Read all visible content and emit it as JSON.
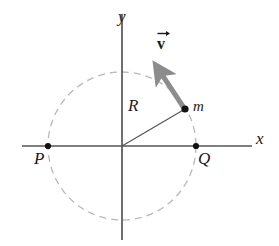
{
  "figure": {
    "background_color": "#ffffff",
    "width": 279,
    "height": 246
  },
  "axes": {
    "x_label": "x",
    "y_label": "y",
    "color": "#555555",
    "origin": {
      "x": 122,
      "y": 146
    },
    "x_start": {
      "x": 22,
      "y": 146
    },
    "x_end": {
      "x": 252,
      "y": 146
    },
    "y_start": {
      "x": 122,
      "y": 14
    },
    "y_end": {
      "x": 122,
      "y": 240
    }
  },
  "circle": {
    "label": "orbit-path",
    "center": {
      "x": 122,
      "y": 146
    },
    "radius": 74,
    "color": "#b9b9b9",
    "style": "dashed",
    "dash_pattern": "7 5"
  },
  "points": [
    {
      "name": "P",
      "label": "P",
      "x": 48,
      "y": 146
    },
    {
      "name": "Q",
      "label": "Q",
      "x": 196,
      "y": 146
    },
    {
      "name": "m",
      "label": "m",
      "x": 185,
      "y": 109
    }
  ],
  "radius_line": {
    "label": "R",
    "color": "#555555",
    "from": {
      "x": 122,
      "y": 146
    },
    "to": {
      "x": 185,
      "y": 109
    }
  },
  "velocity_vector": {
    "label": "v",
    "label_accent": "arrow-overbar",
    "color": "#8c8c8c",
    "from": {
      "x": 184,
      "y": 108
    },
    "to": {
      "x": 155,
      "y": 64
    },
    "line_width": 5,
    "arrowhead_width": 13
  },
  "colors": {
    "axis": "#555555",
    "circle": "#b9b9b9",
    "vector": "#8c8c8c",
    "point": "#111111",
    "text": "#1a1a1a"
  }
}
